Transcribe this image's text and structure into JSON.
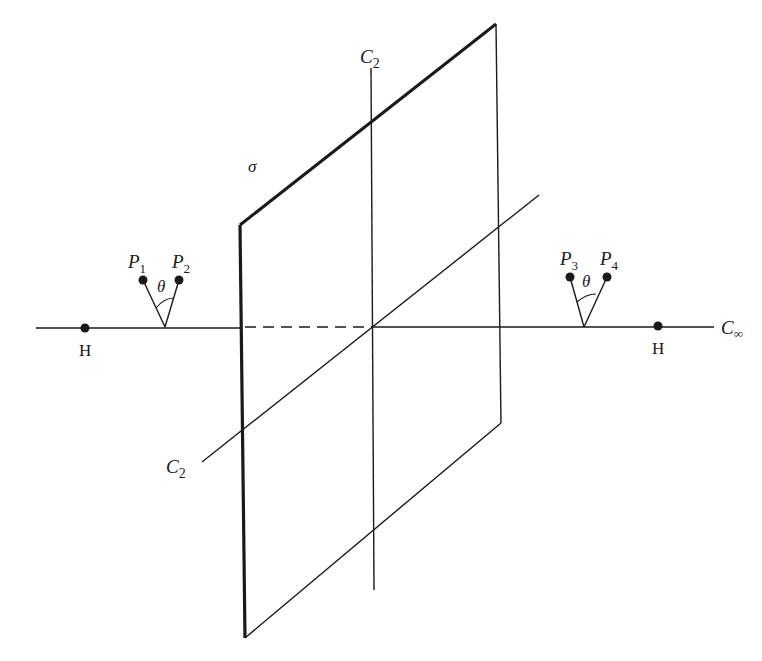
{
  "diagram": {
    "type": "geometric-figure",
    "colors": {
      "ink": "#1a1a1a",
      "background": "#ffffff"
    }
  },
  "labels": {
    "plane": "σ",
    "c2_top": "C",
    "c2_top_sub": "2",
    "c2_left": "C",
    "c2_left_sub": "2",
    "c_inf": "C",
    "c_inf_sub": "∞",
    "p1": "P",
    "p1_sub": "1",
    "p2": "P",
    "p2_sub": "2",
    "p3": "P",
    "p3_sub": "3",
    "p4": "P",
    "p4_sub": "4",
    "theta_left": "θ",
    "theta_right": "θ",
    "h_left": "H",
    "h_right": "H"
  },
  "elements": {
    "plane_sigma": [
      "top-left (240,225)",
      "top-right (496,24)",
      "bottom-right (501,423)",
      "bottom-left (245,638)"
    ],
    "axis_c_infinity": {
      "from": [
        36,
        328
      ],
      "to": [
        714,
        327
      ],
      "dashed_segment_behind_plane": [
        243,
        372
      ]
    },
    "vertical_c2": {
      "from": [
        371,
        68
      ],
      "to": [
        374,
        590
      ]
    },
    "diagonal_c2": {
      "from": [
        202,
        462
      ],
      "to": [
        539,
        195
      ]
    },
    "points": [
      {
        "name": "H",
        "x": 85,
        "y": 328
      },
      {
        "name": "P1",
        "x": 143,
        "y": 280
      },
      {
        "name": "P2",
        "x": 179,
        "y": 280
      },
      {
        "name": "P3",
        "x": 570,
        "y": 277
      },
      {
        "name": "P4",
        "x": 607,
        "y": 277
      },
      {
        "name": "H",
        "x": 658,
        "y": 326
      }
    ]
  }
}
